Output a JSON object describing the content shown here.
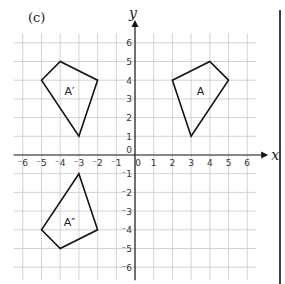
{
  "part_label": "(c)",
  "axes": {
    "x_label": "x",
    "y_label": "y",
    "x_ticks": [
      "-6",
      "-5",
      "-4",
      "-3",
      "-2",
      "-1",
      "0",
      "1",
      "2",
      "3",
      "4",
      "5",
      "6"
    ],
    "y_ticks": [
      "6",
      "5",
      "4",
      "3",
      "2",
      "1",
      "-1",
      "-2",
      "-3",
      "-4",
      "-5",
      "-6"
    ],
    "range": [
      -6,
      6
    ]
  },
  "shapes": [
    {
      "name": "A",
      "label": "A",
      "vertices": [
        [
          2,
          4
        ],
        [
          4,
          5
        ],
        [
          5,
          4
        ],
        [
          3,
          1
        ]
      ],
      "label_pos": [
        3.5,
        3.4
      ]
    },
    {
      "name": "A-prime",
      "label": "A′",
      "vertices": [
        [
          -5,
          4
        ],
        [
          -4,
          5
        ],
        [
          -2,
          4
        ],
        [
          -3,
          1
        ]
      ],
      "label_pos": [
        -3.5,
        3.4
      ]
    },
    {
      "name": "A-double-prime",
      "label": "A″",
      "vertices": [
        [
          -5,
          -4
        ],
        [
          -4,
          -5
        ],
        [
          -2,
          -4
        ],
        [
          -3,
          -1
        ]
      ],
      "label_pos": [
        -3.5,
        -3.6
      ]
    }
  ],
  "colors": {
    "grid": "#c8c8c8",
    "axis": "#111111",
    "shape": "#111111"
  }
}
